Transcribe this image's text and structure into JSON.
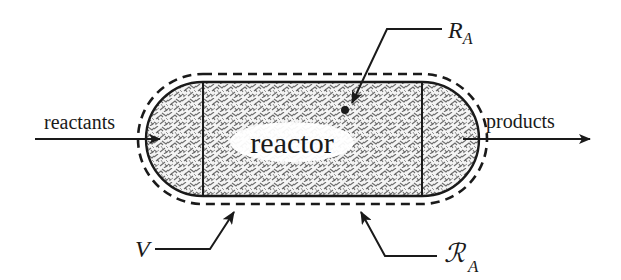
{
  "diagram": {
    "labels": {
      "reactants": "reactants",
      "products": "products",
      "reactor": "reactor",
      "reaction_rate_symbol": "R",
      "reaction_rate_subscript": "A",
      "volume_symbol": "V",
      "surface_rate_symbol": "ℛ",
      "surface_rate_subscript": "A"
    },
    "elements": {
      "inlet_stream": "reactants",
      "outlet_stream": "products",
      "vessel": "reactor",
      "control_volume_boundary": "dashed outline",
      "fill_pattern": "packed / porous medium hatching"
    },
    "colors": {
      "stroke": "#1a1a1a",
      "fill_pattern_line": "#6b6b6b",
      "label_background": "#ffffff",
      "background": "#ffffff"
    }
  }
}
